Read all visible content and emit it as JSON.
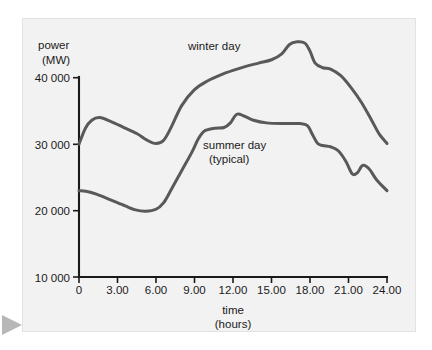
{
  "chart_data": {
    "type": "line",
    "title": "",
    "xlabel": "time",
    "xlabel_unit": "(hours)",
    "ylabel": "power",
    "ylabel_unit": "(MW)",
    "xlim": [
      0,
      24
    ],
    "ylim": [
      10000,
      40000
    ],
    "grid": false,
    "legend_position": "inline-annotations",
    "x_ticks": [
      {
        "value": 0,
        "label": "0"
      },
      {
        "value": 3,
        "label": "3.00"
      },
      {
        "value": 6,
        "label": "6.00"
      },
      {
        "value": 9,
        "label": "9.00"
      },
      {
        "value": 12,
        "label": "12.00"
      },
      {
        "value": 15,
        "label": "15.00"
      },
      {
        "value": 18,
        "label": "18.00"
      },
      {
        "value": 21,
        "label": "21.00"
      },
      {
        "value": 24,
        "label": "24.00"
      }
    ],
    "y_ticks": [
      {
        "value": 10000,
        "label": "10 000"
      },
      {
        "value": 20000,
        "label": "20 000"
      },
      {
        "value": 30000,
        "label": "30 000"
      },
      {
        "value": 40000,
        "label": "40 000"
      }
    ],
    "series": [
      {
        "name": "winter day",
        "label": "winter day",
        "color": "#595959",
        "x": [
          0,
          0.5,
          1.0,
          1.6,
          2.5,
          3.5,
          4.5,
          5.3,
          6.0,
          6.6,
          7.2,
          8.0,
          9.0,
          10.0,
          11.0,
          12.0,
          13.0,
          14.0,
          15.0,
          15.8,
          16.4,
          17.0,
          17.6,
          18.0,
          18.4,
          19.0,
          19.6,
          20.4,
          21.2,
          22.0,
          22.8,
          23.4,
          24.0
        ],
        "y": [
          30000,
          32400,
          33600,
          34000,
          33400,
          32500,
          31600,
          30600,
          30100,
          30600,
          32600,
          35800,
          38200,
          39500,
          40400,
          41100,
          41700,
          42200,
          42700,
          43600,
          45000,
          45400,
          45200,
          44000,
          42200,
          41500,
          41300,
          40300,
          38500,
          36300,
          33600,
          31500,
          30100
        ]
      },
      {
        "name": "summer day (typical)",
        "label": "summer day",
        "label_line2": "(typical)",
        "color": "#595959",
        "x": [
          0,
          0.8,
          1.6,
          2.6,
          3.6,
          4.4,
          5.2,
          6.0,
          6.6,
          7.2,
          8.0,
          8.8,
          9.3,
          9.8,
          10.6,
          11.3,
          11.8,
          12.3,
          12.9,
          13.6,
          14.6,
          16.0,
          17.2,
          17.8,
          18.2,
          18.6,
          19.0,
          19.6,
          20.2,
          20.8,
          21.3,
          21.7,
          22.1,
          22.6,
          23.2,
          24.0
        ],
        "y": [
          23000,
          22800,
          22300,
          21500,
          20700,
          20100,
          19900,
          20200,
          21200,
          23200,
          26000,
          28800,
          30800,
          32000,
          32400,
          32500,
          33200,
          34500,
          34200,
          33600,
          33200,
          33100,
          33100,
          32800,
          31400,
          30100,
          29800,
          29600,
          29000,
          27400,
          25500,
          25700,
          26800,
          26300,
          24600,
          23000
        ]
      }
    ]
  },
  "annotations": {
    "winter_label": "winter day",
    "summer_label_line1": "summer day",
    "summer_label_line2": "(typical)"
  },
  "colors": {
    "panel_background": "#f2f2f2",
    "curve": "#595959",
    "axis": "#1a1a1a",
    "pointer": "#b7b7b7"
  },
  "pointer": {
    "name": "left-pointer-arrow"
  }
}
